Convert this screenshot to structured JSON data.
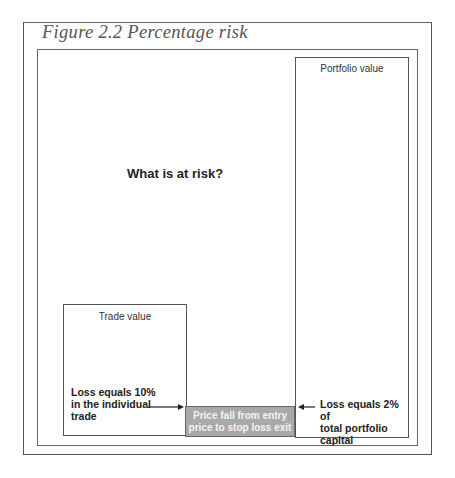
{
  "figure": {
    "title": "Figure 2.2 Percentage risk",
    "question": "What is at risk?",
    "portfolio_box": {
      "label": "Portfolio value"
    },
    "trade_box": {
      "label": "Trade value"
    },
    "stop_loss_box": {
      "line1": "Price fall from entry",
      "line2": "price to stop loss exit",
      "fill_color": "#a9a9a9"
    },
    "annotations": {
      "trade_loss": [
        "Loss equals 10%",
        "in the individual",
        "trade"
      ],
      "portfolio_loss": [
        "Loss equals 2% of",
        "total portfolio",
        "capital"
      ]
    }
  }
}
